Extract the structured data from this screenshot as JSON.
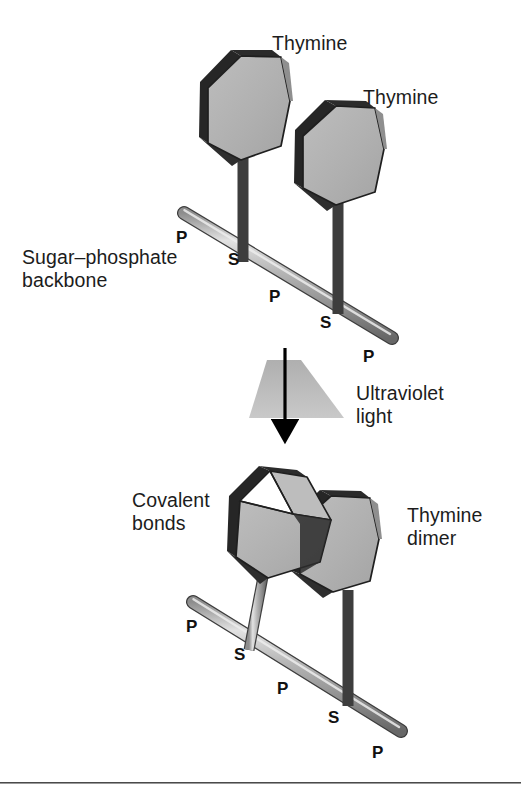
{
  "figure": {
    "title_alt": "Formation of a thymine dimer by ultraviolet light",
    "background_color": "#ffffff",
    "rule_color": "#4a4a4a"
  },
  "colors": {
    "base_fill": "#b2b2b2",
    "base_fill_light": "#c2c2c2",
    "base_fill_dark": "#9d9d9d",
    "edge_dark": "#262626",
    "edge_outline": "#1f1f1f",
    "backbone_light": "#d9d9d9",
    "backbone_mid": "#a8a8a8",
    "backbone_dark": "#6e6e6e",
    "uv_beam": "#b9b9b9",
    "arrow": "#000000",
    "text": "#1c1c1c"
  },
  "labels": {
    "thymine_top_left": "Thymine",
    "thymine_top_right": "Thymine",
    "sugar_phosphate_backbone": "Sugar–phosphate\nbackbone",
    "ultraviolet_light": "Ultraviolet\nlight",
    "covalent_bonds": "Covalent\nbonds",
    "thymine_dimer": "Thymine\ndimer"
  },
  "backbone_top": {
    "groups": [
      {
        "text": "P",
        "x": 176,
        "y": 229
      },
      {
        "text": "S",
        "x": 228,
        "y": 251
      },
      {
        "text": "P",
        "x": 269,
        "y": 288
      },
      {
        "text": "S",
        "x": 320,
        "y": 314
      },
      {
        "text": "P",
        "x": 363,
        "y": 348
      }
    ]
  },
  "backbone_bottom": {
    "groups": [
      {
        "text": "P",
        "x": 186,
        "y": 618
      },
      {
        "text": "S",
        "x": 234,
        "y": 646
      },
      {
        "text": "P",
        "x": 277,
        "y": 680
      },
      {
        "text": "S",
        "x": 328,
        "y": 709
      },
      {
        "text": "P",
        "x": 372,
        "y": 744
      }
    ]
  },
  "uv": {
    "beam_top_y": 360,
    "beam_bottom_y": 418,
    "arrow_top_y": 348,
    "arrow_bottom_y": 437
  }
}
